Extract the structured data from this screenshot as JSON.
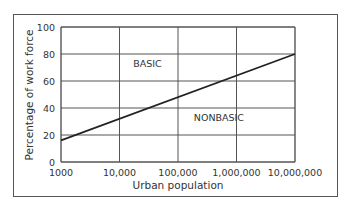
{
  "chart_data": {
    "type": "line",
    "title": "",
    "xlabel": "Urban population",
    "ylabel": "Percentage of work force",
    "x_scale": "log",
    "x_ticks": [
      1000,
      10000,
      100000,
      1000000,
      10000000
    ],
    "x_tick_labels": [
      "1000",
      "10,000",
      "100,000",
      "1,000,000",
      "10,000,000"
    ],
    "y_ticks": [
      0,
      20,
      40,
      60,
      80,
      100
    ],
    "y_tick_labels": [
      "0",
      "20",
      "40",
      "60",
      "80",
      "100"
    ],
    "xlim": [
      1000,
      10000000
    ],
    "ylim": [
      0,
      100
    ],
    "grid": true,
    "series": [
      {
        "name": "Basic/Nonbasic boundary",
        "x": [
          1000,
          10000000
        ],
        "y": [
          16,
          80
        ]
      }
    ],
    "annotations": [
      {
        "text": "BASIC",
        "x": 30000,
        "y": 73
      },
      {
        "text": "NONBASIC",
        "x": 500000,
        "y": 33
      }
    ]
  }
}
